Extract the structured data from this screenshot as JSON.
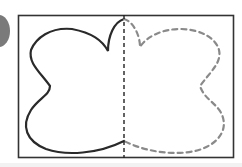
{
  "figure": {
    "colors": {
      "frame": "#333333",
      "solid_outline": "#2a2a2a",
      "dashed_outline": "#8a8a8a",
      "fold_line": "#222222",
      "badge": "#7a7a7a"
    }
  }
}
